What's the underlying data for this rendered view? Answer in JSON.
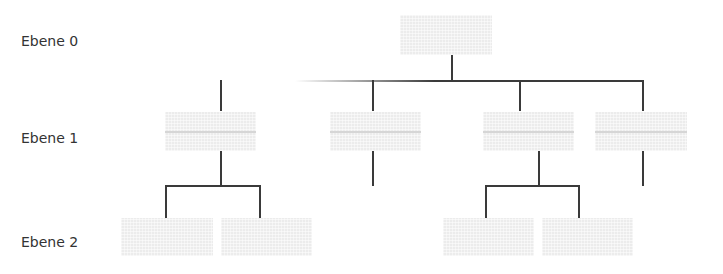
{
  "levels": {
    "level0": "Ebene 0",
    "level1": "Ebene 1",
    "level2": "Ebene 2"
  },
  "nodes": {
    "root": {
      "level": 0,
      "text": ""
    },
    "level1": [
      {
        "id": "a",
        "text": ""
      },
      {
        "id": "b",
        "text": ""
      },
      {
        "id": "c",
        "text": ""
      },
      {
        "id": "d",
        "text": ""
      }
    ],
    "level2": [
      {
        "parent": "a",
        "text": ""
      },
      {
        "parent": "a",
        "text": ""
      },
      {
        "parent": "c",
        "text": ""
      },
      {
        "parent": "c",
        "text": ""
      }
    ]
  },
  "colors": {
    "box_fill": "#ececec",
    "connector": "#3a3a3a",
    "label_text": "#333333"
  }
}
